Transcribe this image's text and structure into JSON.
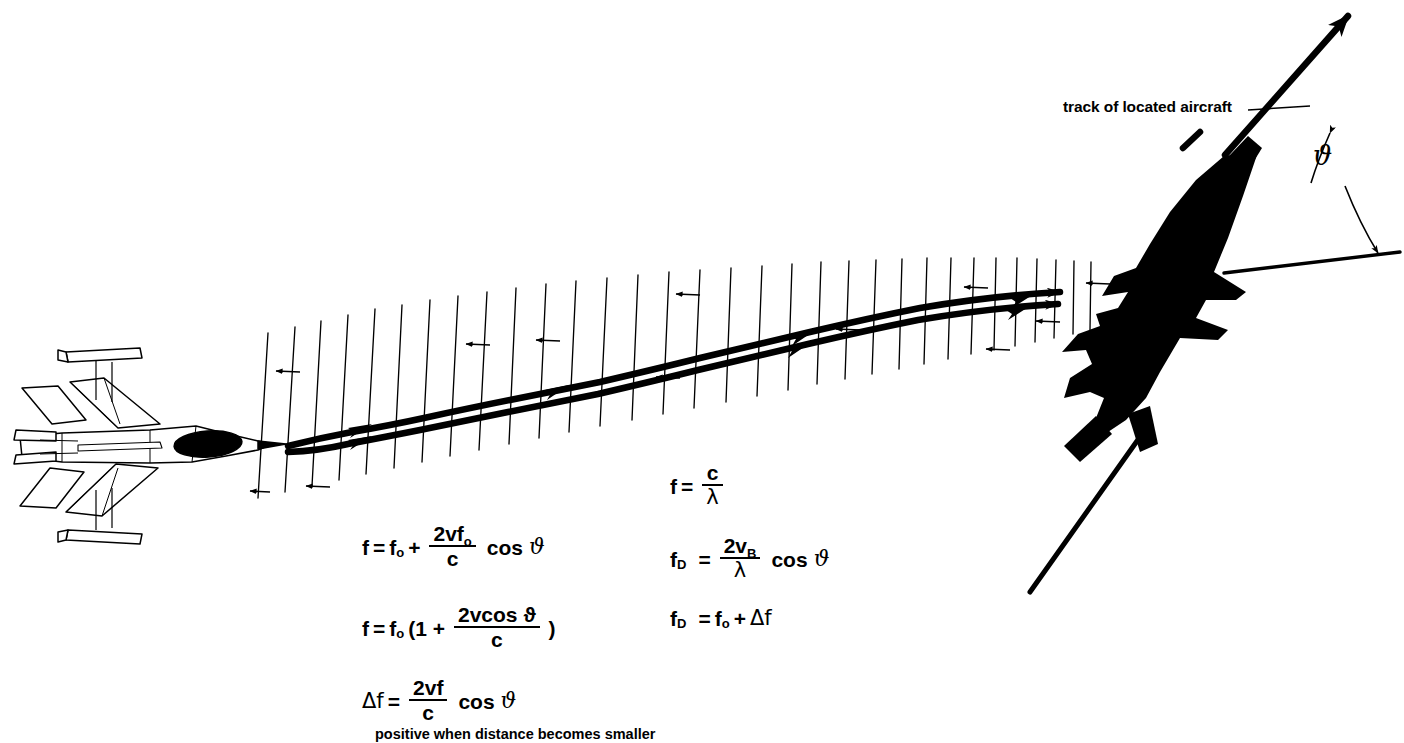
{
  "diagram": {
    "background_color": "#ffffff",
    "ink_color": "#000000",
    "labels": {
      "track_of_located_aircraft": "track of located aircraft",
      "angle_symbol": "ϑ"
    },
    "caption": "positive when distance becomes smaller",
    "objects": {
      "radar_aircraft": "outline-aircraft-icon",
      "target_aircraft": "silhouette-aircraft-icon",
      "beam": "radar-beam-wavefronts",
      "track_arrow": "track-direction-arrow",
      "reference_line": "horizontal-reference-line",
      "angle_arc": "angle-arc-double-arrow"
    }
  },
  "formulas": {
    "left_column": [
      {
        "id": "doppler-shifted-frequency",
        "lhs": "f",
        "eq": "=",
        "term1": "f",
        "term1_sub": "o",
        "op": "+",
        "numerator": "2vf",
        "numerator_sub": "o",
        "denominator": "c",
        "tail": "cos",
        "angle": "ϑ"
      },
      {
        "id": "doppler-factored-frequency",
        "lhs": "f",
        "eq": "=",
        "term1": "f",
        "term1_sub": "o",
        "paren_open": "(1 +",
        "numerator": "2vcos ϑ",
        "denominator": "c",
        "paren_close": ")"
      },
      {
        "id": "frequency-shift",
        "lhs": "Δf",
        "eq": "=",
        "numerator": "2vf",
        "denominator": "c",
        "tail": "cos",
        "angle": "ϑ"
      }
    ],
    "right_column": [
      {
        "id": "frequency-wavelength",
        "lhs": "f",
        "eq": "=",
        "numerator": "c",
        "denominator": "λ"
      },
      {
        "id": "doppler-frequency-wavelength",
        "lhs": "f",
        "lhs_sub": "D",
        "eq": "=",
        "numerator": "2v",
        "numerator_sub": "B",
        "denominator": "λ",
        "tail": "cos",
        "angle": "ϑ"
      },
      {
        "id": "doppler-frequency-sum",
        "lhs": "f",
        "lhs_sub": "D",
        "eq": "=",
        "term1": "f",
        "term1_sub": "o",
        "op": "+",
        "term2": "Δf"
      }
    ]
  }
}
